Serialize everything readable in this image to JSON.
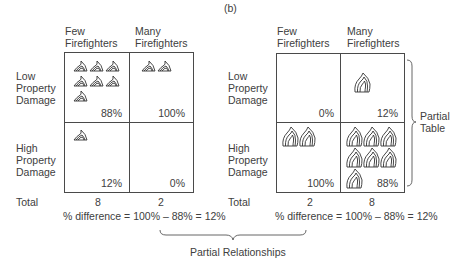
{
  "figure_label": "(b)",
  "column_headers": [
    "Few\nFirefighters",
    "Many\nFirefighters"
  ],
  "row_labels": [
    "Low\nProperty\nDamage",
    "High\nProperty\nDamage"
  ],
  "total_label": "Total",
  "left_table": {
    "cells": [
      {
        "row": "Low Property Damage",
        "col": "Few Firefighters",
        "icons": 7,
        "percent": "88%"
      },
      {
        "row": "Low Property Damage",
        "col": "Many Firefighters",
        "icons": 2,
        "percent": "100%"
      },
      {
        "row": "High Property Damage",
        "col": "Few Firefighters",
        "icons": 1,
        "percent": "12%"
      },
      {
        "row": "High Property Damage",
        "col": "Many Firefighters",
        "icons": 0,
        "percent": "0%"
      }
    ],
    "totals": [
      "8",
      "2"
    ],
    "difference": "% difference = 100% – 88% = 12%"
  },
  "right_table": {
    "cells": [
      {
        "row": "Low Property Damage",
        "col": "Few Firefighters",
        "icons": 0,
        "percent": "0%"
      },
      {
        "row": "Low Property Damage",
        "col": "Many Firefighters",
        "icons": 1,
        "percent": "12%"
      },
      {
        "row": "High Property Damage",
        "col": "Few Firefighters",
        "icons": 2,
        "percent": "100%"
      },
      {
        "row": "High Property Damage",
        "col": "Many Firefighters",
        "icons": 7,
        "percent": "88%"
      }
    ],
    "totals": [
      "2",
      "8"
    ],
    "difference": "% difference = 100% – 88% = 12%"
  },
  "annotations": {
    "partial_table": "Partial\nTable",
    "partial_relationships": "Partial Relationships"
  },
  "icon": "fire-icon"
}
